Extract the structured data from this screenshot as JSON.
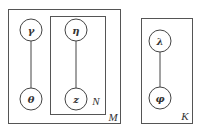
{
  "diagram": {
    "type": "plate-notation",
    "plates": [
      {
        "id": "M",
        "label": "M"
      },
      {
        "id": "N",
        "label": "N"
      },
      {
        "id": "K",
        "label": "K"
      }
    ],
    "nodes": [
      {
        "id": "gamma",
        "label": "γ"
      },
      {
        "id": "theta",
        "label": "θ"
      },
      {
        "id": "eta",
        "label": "η"
      },
      {
        "id": "z",
        "label": "z"
      },
      {
        "id": "lambda",
        "label": "λ"
      },
      {
        "id": "phi",
        "label": "φ"
      }
    ],
    "edges": [
      {
        "from": "gamma",
        "to": "theta"
      },
      {
        "from": "eta",
        "to": "z"
      },
      {
        "from": "lambda",
        "to": "phi"
      }
    ]
  }
}
